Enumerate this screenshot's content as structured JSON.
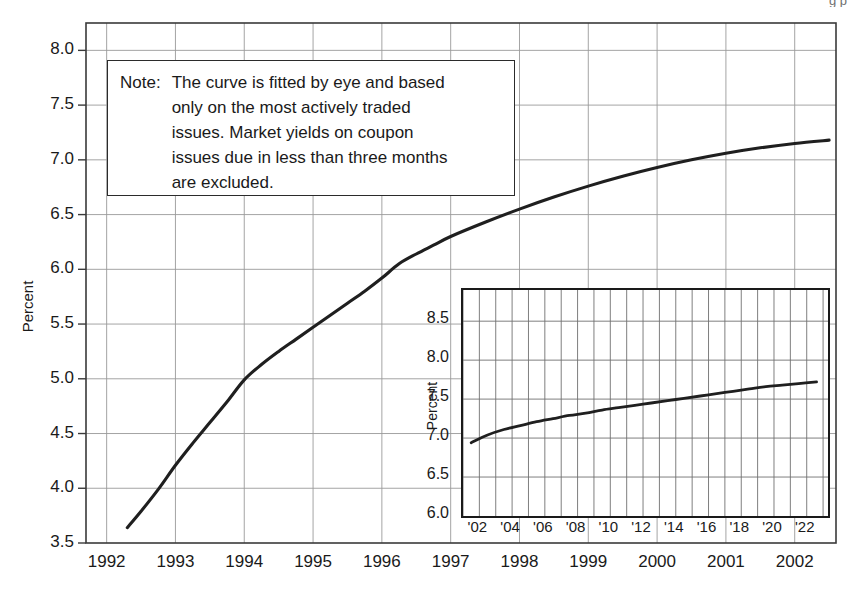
{
  "figure": {
    "background": "#ffffff",
    "ink_color": "#1a1a1a",
    "grid_color": "#9a9a9a",
    "curve_color": "#1f1f1f"
  },
  "note": {
    "label": "Note:",
    "text": "The curve is fitted by eye and based\nonly on the most actively traded\nissues.  Market yields on coupon\nissues due in less than three months\nare excluded."
  },
  "chart_data": {
    "type": "line",
    "title": "",
    "xlabel": "",
    "ylabel": "Percent",
    "xlim": [
      1991.7,
      2002.6
    ],
    "ylim": [
      3.5,
      8.25
    ],
    "grid": true,
    "legend": "none",
    "xtick_labels": [
      "1992",
      "1993",
      "1994",
      "1995",
      "1996",
      "1997",
      "1998",
      "1999",
      "2000",
      "2001",
      "2002"
    ],
    "xtick_values": [
      1992,
      1993,
      1994,
      1995,
      1996,
      1997,
      1998,
      1999,
      2000,
      2001,
      2002
    ],
    "ytick_labels": [
      "3.5",
      "4.0",
      "4.5",
      "5.0",
      "5.5",
      "6.0",
      "6.5",
      "7.0",
      "7.5",
      "8.0"
    ],
    "ytick_values": [
      3.5,
      4.0,
      4.5,
      5.0,
      5.5,
      6.0,
      6.5,
      7.0,
      7.5,
      8.0
    ],
    "series": [
      {
        "name": "Treasury yield curve",
        "x": [
          1992.3,
          1992.5,
          1992.75,
          1993.0,
          1993.25,
          1993.5,
          1993.75,
          1994.0,
          1994.25,
          1994.5,
          1994.75,
          1995.0,
          1995.25,
          1995.5,
          1995.75,
          1996.0,
          1996.25,
          1996.5,
          1996.75,
          1997.0,
          1997.5,
          1998.0,
          1998.5,
          1999.0,
          1999.5,
          2000.0,
          2000.5,
          2001.0,
          2001.5,
          2002.0,
          2002.5
        ],
        "y": [
          3.64,
          3.79,
          3.99,
          4.21,
          4.41,
          4.6,
          4.79,
          4.99,
          5.13,
          5.25,
          5.36,
          5.47,
          5.58,
          5.69,
          5.8,
          5.92,
          6.05,
          6.14,
          6.22,
          6.3,
          6.43,
          6.55,
          6.66,
          6.76,
          6.85,
          6.93,
          7.0,
          7.06,
          7.11,
          7.15,
          7.18
        ]
      }
    ]
  },
  "inset_chart_data": {
    "type": "line",
    "title": "",
    "xlabel": "",
    "ylabel": "Percent",
    "xlim": [
      2001.0,
      2023.3
    ],
    "ylim": [
      6.0,
      8.9
    ],
    "grid": true,
    "legend": "none",
    "xtick_labels": [
      "'02",
      "'04",
      "'06",
      "'08",
      "'10",
      "'12",
      "'14",
      "'16",
      "'18",
      "'20",
      "'22"
    ],
    "xtick_values": [
      2002,
      2004,
      2006,
      2008,
      2010,
      2012,
      2014,
      2016,
      2018,
      2020,
      2022
    ],
    "ytick_labels": [
      "6.0",
      "6.5",
      "7.0",
      "7.5",
      "8.0",
      "8.5"
    ],
    "ytick_values": [
      6.0,
      6.5,
      7.0,
      7.5,
      8.0,
      8.5
    ],
    "series": [
      {
        "name": "Treasury yield curve (long horizon)",
        "x": [
          2001.5,
          2002.5,
          2003.5,
          2004.5,
          2005.5,
          2006.5,
          2007.5,
          2008.5,
          2009.5,
          2010.5,
          2011.5,
          2012.5,
          2013.5,
          2014.5,
          2015.5,
          2016.5,
          2017.5,
          2018.5,
          2019.5,
          2020.5,
          2021.5,
          2022.6
        ],
        "y": [
          6.94,
          7.04,
          7.11,
          7.16,
          7.21,
          7.25,
          7.29,
          7.32,
          7.36,
          7.39,
          7.42,
          7.45,
          7.48,
          7.51,
          7.54,
          7.57,
          7.6,
          7.63,
          7.66,
          7.68,
          7.7,
          7.72
        ]
      }
    ]
  },
  "top_clipped_text": "g      p"
}
